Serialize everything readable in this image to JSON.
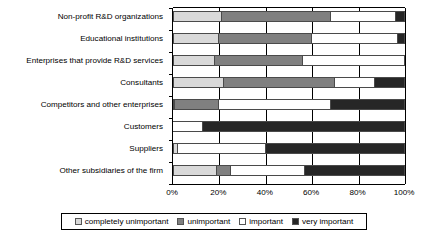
{
  "chart_data": {
    "type": "bar",
    "subtype": "stacked-horizontal-100",
    "title": "",
    "xlabel": "",
    "ylabel": "",
    "xlim": [
      0,
      100
    ],
    "xticks": [
      "0%",
      "20%",
      "40%",
      "60%",
      "80%",
      "100%"
    ],
    "xtick_values": [
      0,
      20,
      40,
      60,
      80,
      100
    ],
    "grid": true,
    "legend_position": "bottom",
    "categories": [
      "Non-profit R&D organizations",
      "Educational institutions",
      "Enterprises that provide R&D services",
      "Consultants",
      "Competitors and other enterprises",
      "Customers",
      "Suppliers",
      "Other subsidiaries of the firm"
    ],
    "series": [
      {
        "name": "completely unimportant",
        "color": "#d9d9d9",
        "values": [
          21,
          20,
          18,
          22,
          1,
          0,
          2,
          19
        ]
      },
      {
        "name": "unimportant",
        "color": "#808080",
        "values": [
          47,
          40,
          38,
          48,
          19,
          0,
          0,
          6
        ]
      },
      {
        "name": "important",
        "color": "#ffffff",
        "values": [
          28,
          37,
          44,
          17,
          48,
          13,
          38,
          32
        ]
      },
      {
        "name": "very important",
        "color": "#262626",
        "values": [
          4,
          3,
          0,
          13,
          32,
          87,
          60,
          43
        ]
      }
    ]
  },
  "legend": {
    "items": [
      {
        "label": "completely unimportant",
        "swatch": "c0"
      },
      {
        "label": "unimportant",
        "swatch": "c1"
      },
      {
        "label": "important",
        "swatch": "c2"
      },
      {
        "label": "very important",
        "swatch": "c3"
      }
    ]
  }
}
